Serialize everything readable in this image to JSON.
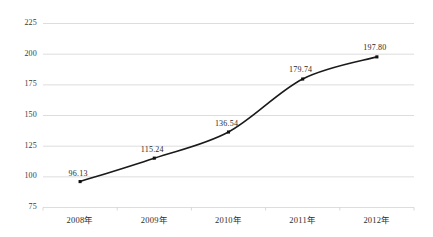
{
  "chart_data": {
    "type": "line",
    "title": "",
    "subtitle": "",
    "xlabel": "",
    "ylabel": "",
    "categories": [
      "2008年",
      "2009年",
      "2010年",
      "2011年",
      "2012年"
    ],
    "values": [
      96.13,
      115.24,
      136.54,
      179.74,
      197.8
    ],
    "point_labels": [
      "96.13",
      "115.24",
      "136.54",
      "179.74",
      "197.80"
    ],
    "ylim": [
      75,
      225
    ],
    "yticks": [
      75,
      100,
      125,
      150,
      175,
      200,
      225
    ],
    "ytick_labels": [
      "75",
      "100",
      "125",
      "150",
      "175",
      "200",
      "225"
    ],
    "grid": true,
    "grid_axis": "y",
    "legend": false,
    "legend_position": "none",
    "series": [
      {
        "name": "",
        "values": [
          96.13,
          115.24,
          136.54,
          179.74,
          197.8
        ],
        "line_color": "#1a1a1a",
        "marker": "square",
        "marker_color": "#111111",
        "smooth": true
      }
    ],
    "colors": {
      "background": "#ffffff",
      "grid": "#d9d9d9",
      "axis_text": "#333333",
      "line": "#1a1a1a",
      "label_text": "#2a2a2a"
    }
  }
}
